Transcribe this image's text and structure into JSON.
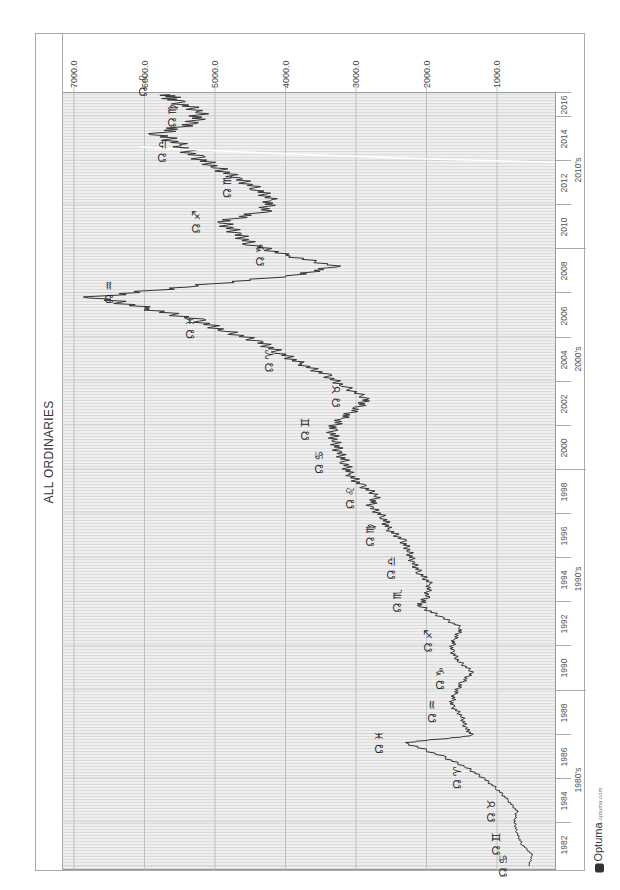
{
  "chart_data": {
    "type": "line",
    "title": "ALL ORDINARIES",
    "orientation": "rotated 90° counter-clockwise (time runs bottom→top, value axis across top, high values on left)",
    "xlabel": "",
    "ylabel": "",
    "ylim": [
      0,
      7000
    ],
    "y_ticks": [
      "7000.0",
      "6000.0",
      "5000.0",
      "4000.0",
      "3000.0",
      "2000.0",
      "1000.0"
    ],
    "x_ticks": [
      "1982",
      "1984",
      "1986",
      "1988",
      "1990",
      "1992",
      "1994",
      "1996",
      "1998",
      "2000",
      "2002",
      "2004",
      "2006",
      "2008",
      "2010",
      "2012",
      "2014",
      "2016",
      "201"
    ],
    "decades": [
      "1980's",
      "1990's",
      "2000's",
      "2010's"
    ],
    "grid": true,
    "series": [
      {
        "name": "All Ordinaries",
        "x": [
          1982.0,
          1982.5,
          1983.0,
          1983.5,
          1984.0,
          1984.5,
          1985.0,
          1985.5,
          1986.0,
          1986.5,
          1987.0,
          1987.6,
          1987.9,
          1988.3,
          1988.8,
          1989.3,
          1989.8,
          1990.3,
          1990.8,
          1991.3,
          1991.8,
          1992.3,
          1992.8,
          1993.3,
          1993.8,
          1994.2,
          1994.8,
          1995.3,
          1995.8,
          1996.3,
          1996.8,
          1997.3,
          1997.8,
          1998.3,
          1998.8,
          1999.3,
          1999.8,
          2000.3,
          2000.8,
          2001.3,
          2001.8,
          2002.3,
          2002.8,
          2003.2,
          2003.8,
          2004.3,
          2004.8,
          2005.3,
          2005.8,
          2006.3,
          2006.8,
          2007.3,
          2007.8,
          2008.3,
          2008.8,
          2009.2,
          2009.7,
          2010.2,
          2010.7,
          2011.2,
          2011.7,
          2012.2,
          2012.7,
          2013.2,
          2013.7,
          2014.2,
          2014.7,
          2015.2,
          2015.7,
          2016.2,
          2016.7,
          2017.0
        ],
        "values": [
          550,
          500,
          650,
          720,
          750,
          720,
          850,
          1000,
          1200,
          1450,
          1800,
          2300,
          1350,
          1450,
          1500,
          1650,
          1600,
          1500,
          1350,
          1550,
          1650,
          1600,
          1500,
          1800,
          2100,
          2000,
          1950,
          2100,
          2200,
          2250,
          2350,
          2550,
          2600,
          2800,
          2700,
          2950,
          3100,
          3150,
          3250,
          3300,
          3350,
          3200,
          2950,
          2850,
          3200,
          3450,
          3800,
          4100,
          4400,
          4900,
          5300,
          6000,
          6700,
          5300,
          3800,
          3300,
          4000,
          4500,
          4700,
          4900,
          4300,
          4200,
          4400,
          4700,
          5000,
          5300,
          5500,
          5800,
          5300,
          5200,
          5600,
          5650
        ]
      }
    ],
    "annotations": [
      {
        "label": "☊ ♋",
        "year": 1982.0
      },
      {
        "label": "☊ ♊",
        "year": 1983.0
      },
      {
        "label": "☊ ♉",
        "year": 1984.5
      },
      {
        "label": "☊ ♈",
        "year": 1986.0
      },
      {
        "label": "☊ ♓",
        "year": 1987.6
      },
      {
        "label": "☊ ♒",
        "year": 1989.0
      },
      {
        "label": "☊ ♑",
        "year": 1990.5
      },
      {
        "label": "☊ ♐",
        "year": 1992.2
      },
      {
        "label": "☊ ♏",
        "year": 1994.0
      },
      {
        "label": "☊ ♎",
        "year": 1995.5
      },
      {
        "label": "☊ ♍",
        "year": 1997.0
      },
      {
        "label": "☊ ♌",
        "year": 1998.7
      },
      {
        "label": "☊ ♋",
        "year": 2000.3
      },
      {
        "label": "☊ ♊",
        "year": 2001.8
      },
      {
        "label": "☊ ♉",
        "year": 2003.3
      },
      {
        "label": "☊ ♈",
        "year": 2004.9
      },
      {
        "label": "☊ ♓",
        "year": 2006.4
      },
      {
        "label": "☊ ♒",
        "year": 2008.0
      },
      {
        "label": "☊ ♑",
        "year": 2009.7
      },
      {
        "label": "☊ ♐",
        "year": 2011.2
      },
      {
        "label": "☊ ♏",
        "year": 2012.8
      },
      {
        "label": "☊ ♎",
        "year": 2014.4
      },
      {
        "label": "☊ ♍",
        "year": 2016.0
      },
      {
        "label": "☊ ♌",
        "year": 2017.4
      }
    ]
  },
  "header": {
    "title": "ALL ORDINARIES"
  },
  "axes": {
    "value_labels": [
      "7000.0",
      "6000.0",
      "5000.0",
      "4000.0",
      "3000.0",
      "2000.0",
      "1000.0"
    ],
    "years": [
      "1982",
      "1984",
      "1986",
      "1988",
      "1990",
      "1992",
      "1994",
      "1996",
      "1998",
      "2000",
      "2002",
      "2004",
      "2006",
      "2008",
      "2010",
      "2012",
      "2014",
      "2016",
      "201"
    ],
    "decades": [
      "1980's",
      "1990's",
      "2000's",
      "2010's"
    ]
  },
  "footer": {
    "brand": "Optuma",
    "brand_suffix": "optuma.com"
  },
  "colors": {
    "line": "#333333",
    "grid": "#dcdcdc",
    "plot_bg": "#efefef",
    "frame": "#aaaaaa"
  }
}
